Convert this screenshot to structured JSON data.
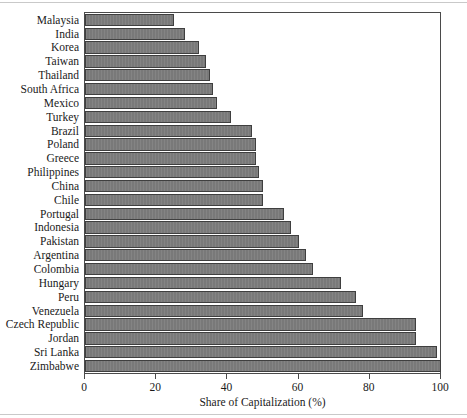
{
  "chart_data": {
    "type": "bar",
    "orientation": "horizontal",
    "title": "",
    "xlabel": "Share of Capitalization (%)",
    "ylabel": "",
    "xlim": [
      0,
      100
    ],
    "xticks": [
      0,
      20,
      40,
      60,
      80,
      100
    ],
    "grid": false,
    "legend": null,
    "bar_color": "#7d7d7d",
    "bar_edge_color": "#3f3f3f",
    "categories": [
      "Malaysia",
      "India",
      "Korea",
      "Taiwan",
      "Thailand",
      "South Africa",
      "Mexico",
      "Turkey",
      "Brazil",
      "Poland",
      "Greece",
      "Philippines",
      "China",
      "Chile",
      "Portugal",
      "Indonesia",
      "Pakistan",
      "Argentina",
      "Colombia",
      "Hungary",
      "Peru",
      "Venezuela",
      "Czech Republic",
      "Jordan",
      "Sri Lanka",
      "Zimbabwe"
    ],
    "values": [
      25,
      28,
      32,
      34,
      35,
      36,
      37,
      41,
      47,
      48,
      48,
      49,
      50,
      50,
      56,
      58,
      60,
      62,
      64,
      72,
      76,
      78,
      93,
      93,
      99,
      100
    ]
  },
  "xticklabels": [
    "0",
    "20",
    "40",
    "60",
    "80",
    "100"
  ]
}
